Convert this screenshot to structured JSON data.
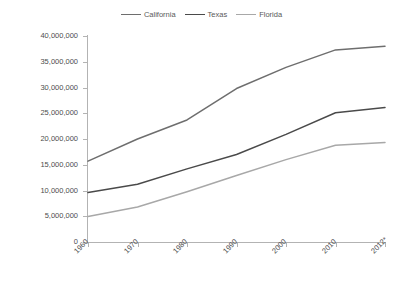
{
  "chart_data": {
    "type": "line",
    "title": "",
    "xlabel": "",
    "ylabel": "",
    "x": [
      "1960",
      "1970",
      "1980",
      "1990",
      "2000",
      "2010",
      "2012*"
    ],
    "categories": [
      "1960",
      "1970",
      "1980",
      "1990",
      "2000",
      "2010",
      "2012*"
    ],
    "ylim": [
      0,
      40000000
    ],
    "yticks": [
      0,
      5000000,
      10000000,
      15000000,
      20000000,
      25000000,
      30000000,
      35000000,
      40000000
    ],
    "ytick_labels": [
      "0",
      "5,000,000",
      "10,000,000",
      "15,000,000",
      "20,000,000",
      "25,000,000",
      "30,000,000",
      "35,000,000",
      "40,000,000"
    ],
    "grid": false,
    "legend_position": "top-center",
    "series": [
      {
        "name": "California",
        "color": "#6e6e6e",
        "values": [
          15700000,
          20000000,
          23700000,
          29800000,
          33900000,
          37300000,
          38000000
        ]
      },
      {
        "name": "Texas",
        "color": "#4a4a4a",
        "values": [
          9600000,
          11200000,
          14200000,
          17000000,
          20900000,
          25100000,
          26100000
        ]
      },
      {
        "name": "Florida",
        "color": "#a8a8a8",
        "values": [
          4950000,
          6800000,
          9750000,
          12900000,
          16000000,
          18800000,
          19300000
        ]
      }
    ]
  }
}
